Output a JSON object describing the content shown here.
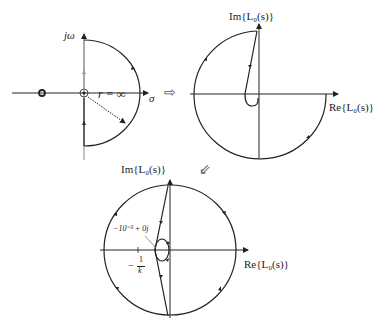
{
  "diagrams": {
    "s_plane": {
      "y_axis_label": "jω",
      "x_axis_label": "σ",
      "radius_label": "r = ∞"
    },
    "nyquist_1": {
      "y_axis_label": "Im{L₀(s)}",
      "x_axis_label": "Re{L₀(s)}"
    },
    "nyquist_2": {
      "y_axis_label": "Im{L₀(s)}",
      "x_axis_label": "Re{L₀(s)}",
      "point_annotation": "−10⁻³ + 0j",
      "critical_point_label": "−1/k",
      "critical_point_num": "1",
      "critical_point_den": "k"
    }
  },
  "arrows": {
    "right_arrow": "⇨",
    "down_left_arrow": "⇙"
  },
  "colors": {
    "stroke": "#222222",
    "grey_axis": "#888888"
  }
}
